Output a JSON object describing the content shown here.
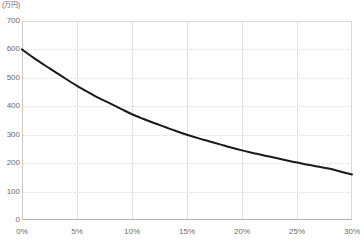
{
  "chart_data": {
    "type": "line",
    "title": "",
    "subtitle": "",
    "unit_label": "(万円)",
    "xlabel": "",
    "ylabel": "",
    "xlim": [
      0,
      30
    ],
    "ylim": [
      0,
      700
    ],
    "grid": true,
    "legend": false,
    "line_color": "#1a1a1a",
    "line_width": 2,
    "x_tick_labels": [
      "0%",
      "5%",
      "10%",
      "15%",
      "20%",
      "25%",
      "30%"
    ],
    "x_ticks": [
      0,
      5,
      10,
      15,
      20,
      25,
      30
    ],
    "y_tick_labels": [
      "0",
      "100",
      "200",
      "300",
      "400",
      "500",
      "600",
      "700"
    ],
    "y_ticks": [
      0,
      100,
      200,
      300,
      400,
      500,
      600,
      700
    ],
    "series": [
      {
        "name": "",
        "x": [
          0,
          1,
          2,
          3,
          4,
          5,
          6,
          7,
          8,
          9,
          10,
          11,
          12,
          13,
          14,
          15,
          16,
          17,
          18,
          19,
          20,
          21,
          22,
          23,
          24,
          25,
          26,
          27,
          28,
          29,
          30
        ],
        "values": [
          600,
          572,
          546,
          521,
          496,
          472,
          450,
          429,
          410,
          391,
          372,
          356,
          341,
          327,
          313,
          300,
          288,
          277,
          266,
          255,
          245,
          236,
          227,
          219,
          210,
          202,
          194,
          187,
          180,
          170,
          160
        ]
      }
    ]
  }
}
